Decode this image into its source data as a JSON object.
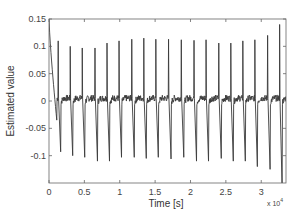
{
  "chart_data": {
    "type": "line",
    "title": "",
    "xlabel": "Time [s]",
    "ylabel": "Estimated value",
    "x_multiplier_label": "x 10",
    "x_multiplier_exponent": "4",
    "xlim": [
      0,
      3.35
    ],
    "ylim": [
      -0.15,
      0.15
    ],
    "xticks": [
      0,
      0.5,
      1,
      1.5,
      2,
      2.5,
      3
    ],
    "xtick_labels": [
      "0",
      "0.5",
      "1",
      "1.5",
      "2",
      "2.5",
      "3"
    ],
    "yticks": [
      -0.1,
      -0.05,
      0,
      0.05,
      0.1,
      0.15
    ],
    "ytick_labels": [
      "-0.1",
      "-0.05",
      "0",
      "0.05",
      "0.1",
      "0.15"
    ],
    "grid": false,
    "legend": null,
    "line_color": "#3a3a3a",
    "series": [
      {
        "name": "Estimated value",
        "description": "Noisy baseline near 0 with periodic sharp positive and negative spikes; initial transient decays from 0.15 to about -0.03",
        "initial_transient": {
          "t_start": 0.0,
          "v_start": 0.15,
          "t_end": 0.11,
          "v_end": -0.035
        },
        "spike_times_x1e4": [
          0.13,
          0.3,
          0.47,
          0.65,
          0.82,
          0.99,
          1.17,
          1.34,
          1.51,
          1.69,
          1.87,
          2.05,
          2.22,
          2.4,
          2.57,
          2.74,
          2.91,
          3.09,
          3.26
        ],
        "spike_peaks": [
          0.11,
          0.1,
          0.097,
          0.097,
          0.106,
          0.11,
          0.113,
          0.115,
          0.113,
          0.113,
          0.112,
          0.111,
          0.112,
          0.106,
          0.106,
          0.11,
          0.112,
          0.12,
          0.14
        ],
        "spike_troughs": [
          -0.093,
          -0.1,
          -0.103,
          -0.11,
          -0.11,
          -0.103,
          -0.103,
          -0.105,
          -0.103,
          -0.106,
          -0.103,
          -0.11,
          -0.11,
          -0.105,
          -0.11,
          -0.11,
          -0.12,
          -0.125,
          -0.16
        ],
        "baseline": 0.005,
        "noise_amplitude": 0.006
      }
    ]
  }
}
